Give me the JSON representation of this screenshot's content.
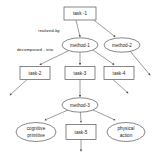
{
  "diagram": {
    "background_color": "#ffffff",
    "node_stroke_color": "#555555",
    "edge_color": "#666666",
    "text_color": "#1a1a1a",
    "nodes": [
      {
        "id": "task-1",
        "label": "task -1",
        "shape": "rect",
        "cx": 80,
        "cy": 13.5,
        "w": 32,
        "h": 13
      },
      {
        "id": "method-1",
        "label": "method-1",
        "shape": "ellipse",
        "cx": 80,
        "cy": 45,
        "w": 36,
        "h": 14
      },
      {
        "id": "method-2",
        "label": "method-2",
        "shape": "ellipse",
        "cx": 122,
        "cy": 45,
        "w": 36,
        "h": 14
      },
      {
        "id": "task-2",
        "label": "task-2",
        "shape": "rect",
        "cx": 35,
        "cy": 73,
        "w": 30,
        "h": 13
      },
      {
        "id": "task-3",
        "label": "task-3",
        "shape": "rect",
        "cx": 80,
        "cy": 73,
        "w": 30,
        "h": 13
      },
      {
        "id": "task-4",
        "label": "task-4",
        "shape": "rect",
        "cx": 119,
        "cy": 73,
        "w": 30,
        "h": 13
      },
      {
        "id": "method-3",
        "label": "method-3",
        "shape": "ellipse",
        "cx": 80,
        "cy": 105,
        "w": 36,
        "h": 14
      },
      {
        "id": "cognitive-primitive",
        "label": "cognitive",
        "label2": "primitive",
        "shape": "ellipse",
        "cx": 36,
        "cy": 132,
        "w": 40,
        "h": 19
      },
      {
        "id": "task-5",
        "label": "task-5",
        "shape": "rect",
        "cx": 81,
        "cy": 132,
        "w": 30,
        "h": 15
      },
      {
        "id": "physical-action",
        "label": "physical",
        "label2": "action",
        "shape": "ellipse",
        "cx": 126,
        "cy": 132,
        "w": 38,
        "h": 19
      }
    ],
    "edge_labels": [
      {
        "id": "realized-by",
        "text": "realized-by",
        "x": 49,
        "y": 31
      },
      {
        "id": "decomposed-into",
        "text": "decomposed - into",
        "x": 35,
        "y": 50
      }
    ],
    "edges": [
      {
        "from": "task-1",
        "to": "method-1",
        "arrow": true
      },
      {
        "from": "task-1",
        "to": "method-2",
        "arrow": true
      },
      {
        "from": "method-1",
        "to": "task-2",
        "arrow": true
      },
      {
        "from": "method-1",
        "to": "task-3",
        "arrow": true
      },
      {
        "from": "method-1",
        "to": "task-4",
        "arrow": true
      },
      {
        "from": "method-2",
        "to": "dangling-right",
        "arrow": true
      },
      {
        "from": "task-2",
        "to": "dangling-left",
        "arrow": true
      },
      {
        "from": "task-3",
        "to": "method-3",
        "arrow": true
      },
      {
        "from": "task-4",
        "to": "dangling-mid-right",
        "arrow": true
      },
      {
        "from": "method-3",
        "to": "cognitive-primitive",
        "arrow": true
      },
      {
        "from": "method-3",
        "to": "task-5",
        "arrow": true
      },
      {
        "from": "method-3",
        "to": "physical-action",
        "arrow": true
      },
      {
        "from": "task-5",
        "to": "dangling-bottom",
        "arrow": true
      }
    ]
  }
}
